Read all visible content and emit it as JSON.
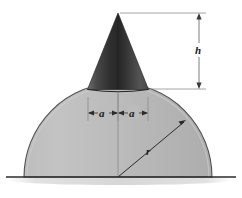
{
  "figure": {
    "background_color": "#ffffff",
    "labels": {
      "height": "h",
      "radius": "r",
      "half_base_left": "a",
      "half_base_right": "a"
    },
    "colors": {
      "dome_fill": "#b7b7b7",
      "dome_fill_light": "#c6c6c6",
      "dome_outline": "#4a4a4a",
      "cone_dark": "#2f2f2f",
      "cone_mid": "#4c4c4c",
      "cone_light": "#6a6a6a",
      "ground_line": "#2b2b2b",
      "ground_shadow": "#d8d8d8",
      "dimension_line": "#6e6e6e",
      "label_text": "#1a1a1a"
    },
    "geometry": {
      "dome_center_x": 118,
      "dome_base_y": 177,
      "dome_radius": 94,
      "cone_apex_x": 118,
      "cone_apex_y": 13,
      "cone_base_left_x": 88,
      "cone_base_right_x": 148,
      "cone_base_y": 90,
      "height_dim_line_x": 199,
      "height_dim_top_y": 13,
      "height_dim_bottom_y": 89,
      "a_dim_line_y": 113,
      "radius_end_x": 186,
      "radius_end_y": 120,
      "ground_line_y": 177,
      "ground_line_x1": 6,
      "ground_line_x2": 236
    }
  }
}
